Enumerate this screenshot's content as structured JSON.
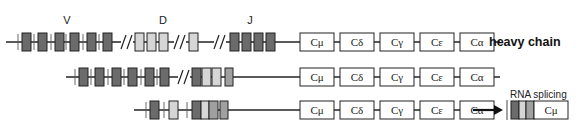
{
  "diagram": {
    "title": "heavy chain",
    "segment_labels": [
      {
        "text": "V",
        "x": 67,
        "y": 24
      },
      {
        "text": "D",
        "x": 163,
        "y": 24
      },
      {
        "text": "J",
        "x": 250,
        "y": 24
      }
    ],
    "note": "RNA splicing",
    "colors": {
      "dark": "#6b6b6b",
      "light": "#d6d6d6",
      "mid": "#a0a0a0",
      "line": "#222222",
      "c_fill": "#ffffff"
    },
    "constant_labels": [
      "Cμ",
      "Cδ",
      "Cγ",
      "Cε",
      "Cα"
    ],
    "rows": [
      {
        "name": "germline",
        "y": 42,
        "line_start": 6,
        "line_end": 296,
        "segments": [
          {
            "x": 22,
            "w": 9,
            "shade": "dark"
          },
          {
            "x": 38,
            "w": 9,
            "shade": "dark"
          },
          {
            "x": 55,
            "w": 9,
            "shade": "dark"
          },
          {
            "x": 70,
            "w": 9,
            "shade": "dark"
          },
          {
            "x": 87,
            "w": 9,
            "shade": "dark"
          },
          {
            "x": 103,
            "w": 9,
            "shade": "dark"
          },
          {
            "x": 135,
            "w": 9,
            "shade": "light"
          },
          {
            "x": 147,
            "w": 9,
            "shade": "light"
          },
          {
            "x": 159,
            "w": 9,
            "shade": "light"
          },
          {
            "x": 189,
            "w": 9,
            "shade": "light"
          },
          {
            "x": 230,
            "w": 9,
            "shade": "dark"
          },
          {
            "x": 242,
            "w": 9,
            "shade": "dark"
          },
          {
            "x": 254,
            "w": 9,
            "shade": "dark"
          },
          {
            "x": 266,
            "w": 9,
            "shade": "dark"
          }
        ],
        "ticks": [
          18,
          34,
          51,
          66,
          83,
          99
        ],
        "breaks": [
          123,
          176,
          216
        ],
        "c_start": 300
      },
      {
        "name": "dj-rearranged",
        "y": 77,
        "line_start": 66,
        "line_end": 296,
        "segments": [
          {
            "x": 79,
            "w": 9,
            "shade": "dark"
          },
          {
            "x": 95,
            "w": 9,
            "shade": "dark"
          },
          {
            "x": 112,
            "w": 9,
            "shade": "dark"
          },
          {
            "x": 128,
            "w": 9,
            "shade": "dark"
          },
          {
            "x": 145,
            "w": 9,
            "shade": "dark"
          },
          {
            "x": 160,
            "w": 9,
            "shade": "dark"
          },
          {
            "x": 192,
            "w": 9,
            "shade": "dark"
          },
          {
            "x": 202,
            "w": 9,
            "shade": "light"
          },
          {
            "x": 212,
            "w": 9,
            "shade": "light"
          },
          {
            "x": 225,
            "w": 8,
            "shade": "mid"
          }
        ],
        "ticks": [
          75,
          91,
          108,
          124,
          141,
          157
        ],
        "breaks": [
          180
        ],
        "c_start": 300
      },
      {
        "name": "vdj-rearranged",
        "y": 110,
        "line_start": 134,
        "line_end": 296,
        "segments": [
          {
            "x": 150,
            "w": 9,
            "shade": "dark"
          },
          {
            "x": 169,
            "w": 9,
            "shade": "light"
          },
          {
            "x": 192,
            "w": 9,
            "shade": "dark"
          },
          {
            "x": 201,
            "w": 8,
            "shade": "light"
          },
          {
            "x": 209,
            "w": 9,
            "shade": "mid"
          },
          {
            "x": 220,
            "w": 8,
            "shade": "mid"
          }
        ],
        "ticks": [
          146,
          164,
          187
        ],
        "breaks": [],
        "c_start": 300
      }
    ],
    "splice_product": {
      "x": 511,
      "y": 110,
      "segments": [
        {
          "w": 8,
          "shade": "dark"
        },
        {
          "w": 7,
          "shade": "light"
        },
        {
          "w": 8,
          "shade": "mid"
        }
      ],
      "c_label": "Cμ",
      "c_w": 34
    }
  }
}
